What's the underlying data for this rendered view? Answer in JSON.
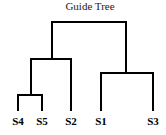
{
  "title": "Guide Tree",
  "colors": {
    "line": "#000000",
    "text": "#000000",
    "background": "#ffffff"
  },
  "leaves": [
    {
      "label": "S4",
      "x": 18
    },
    {
      "label": "S5",
      "x": 42
    },
    {
      "label": "S2",
      "x": 71
    },
    {
      "label": "S1",
      "x": 101
    },
    {
      "label": "S3",
      "x": 153
    }
  ],
  "tree": "(((S4,S5),S2),(S1,S3))"
}
